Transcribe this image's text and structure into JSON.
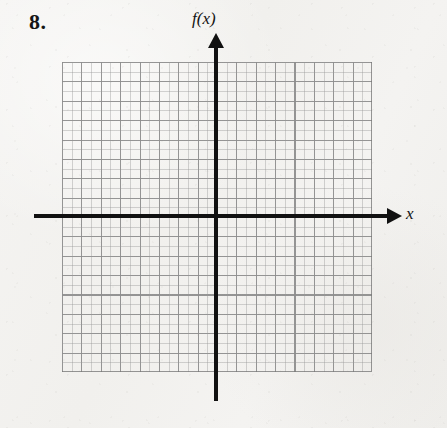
{
  "page": {
    "background_color": "#f3f2f0",
    "width": 447,
    "height": 428
  },
  "problem": {
    "number_label": "8."
  },
  "chart_data": {
    "type": "scatter",
    "title": "",
    "subtitle": "",
    "xlabel": "x",
    "ylabel": "f(x)",
    "x_axis_label": "x",
    "y_axis_label": "f(x)",
    "series": [
      {
        "name": "empty-graph",
        "x": [],
        "y": []
      }
    ],
    "categories": [],
    "values": [],
    "xlim": [
      -8,
      8
    ],
    "ylim": [
      -8,
      8
    ],
    "grid": true,
    "grid_columns": 16,
    "grid_rows": 16,
    "minor_grid": true,
    "minor_divisions_per_cell": 2,
    "tick_labels_x": [],
    "tick_labels_y": [],
    "legend": false,
    "legend_position": "none",
    "annotations": [],
    "axis_arrows": {
      "x_positive": true,
      "x_negative": false,
      "y_positive": true,
      "y_negative": false
    },
    "origin_at_center": true,
    "colors": {
      "axis": "#111111",
      "major_grid": "#787878",
      "minor_grid": "#969696",
      "text": "#131313"
    }
  }
}
